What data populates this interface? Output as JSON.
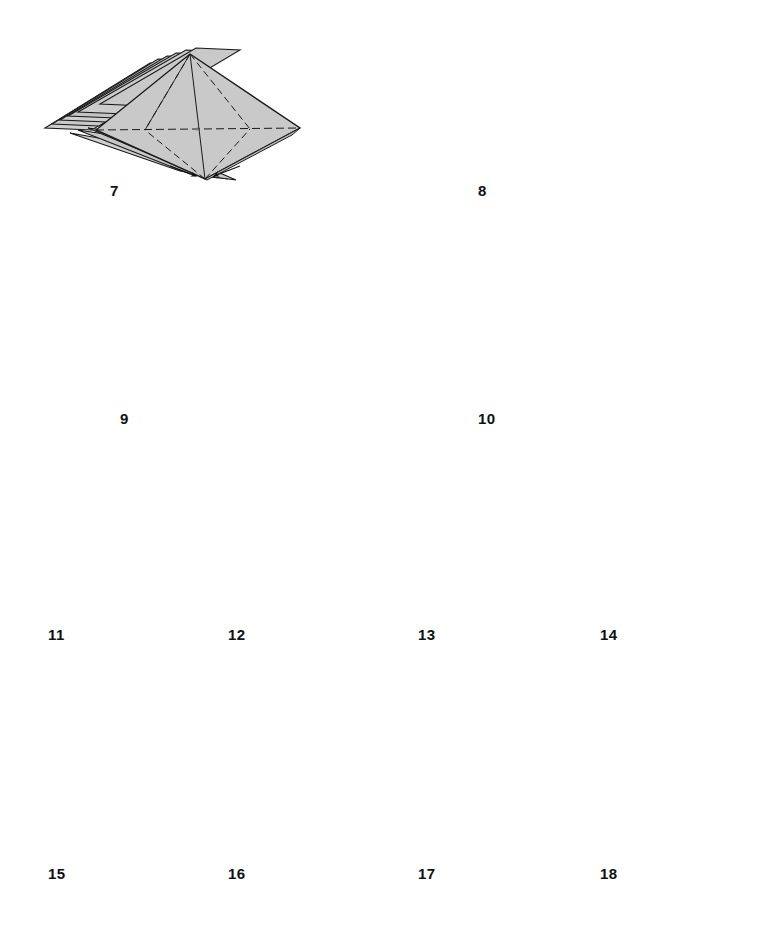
{
  "document": {
    "kind": "origami-instruction-diagram",
    "page_background": "#ffffff",
    "paper_fill": "#c9c9c9",
    "paper_fill_light": "#d6d6d6",
    "paper_fill_dark": "#b4b4b4",
    "line_color": "#1a1a1a",
    "crease_color": "#333333",
    "total_steps": 12,
    "step_range": "7-18"
  },
  "rows": [
    {
      "name": "row-1",
      "steps": [
        "7",
        "8"
      ]
    },
    {
      "name": "row-2",
      "steps": [
        "9",
        "10"
      ]
    },
    {
      "name": "row-3",
      "steps": [
        "11",
        "12",
        "13",
        "14"
      ]
    },
    {
      "name": "row-4",
      "steps": [
        "15",
        "16",
        "17",
        "18"
      ]
    }
  ],
  "steps": [
    {
      "number": "7",
      "label": "7",
      "label_x": 110,
      "label_y": 183,
      "figure": "flat-pleated-stack-3d",
      "description": "Three-dimensional view of a pleated square base stack seen from above with dashed diagonal creases converging at center",
      "has_dashed_creases": true,
      "has_arrows": false
    },
    {
      "number": "8",
      "label": "8",
      "label_x": 478,
      "label_y": 183,
      "figure": "flat-pleated-stack-3d-collapsed",
      "description": "Same stack after partially collapsing, central pleat pulled together, fine radial creases visible",
      "has_dashed_creases": false,
      "has_arrows": false
    },
    {
      "number": "9",
      "label": "9",
      "label_x": 120,
      "label_y": 411,
      "figure": "accordion-strip-side-view",
      "description": "Accordion-pleated strip seen edge-on with four radial star crease groups; small straight arrows point inward at each star center",
      "cells": 4,
      "arrows": 4,
      "arrow_type": "push-in-straight",
      "has_dashed_creases": false
    },
    {
      "number": "10",
      "label": "10",
      "label_x": 478,
      "label_y": 411,
      "figure": "flat-rectangle-crease-pattern",
      "description": "Flattened rectangle showing complete crease pattern of valley (dashed) and mountain (dash-dot) folds in four radial star units; loop arrows wrap around top and bottom edges",
      "cells": 4,
      "top_loop_arrows": 5,
      "bottom_loop_arrows": 5,
      "has_dashed_creases": true
    },
    {
      "number": "11",
      "label": "11",
      "label_x": 48,
      "label_y": 627,
      "figure": "fanned-diamond-stack",
      "description": "Stack of diamond-shaped layers fanned out to the left showing many separate sheets",
      "layers": 6,
      "has_arrows": false
    },
    {
      "number": "12",
      "label": "12",
      "label_x": 228,
      "label_y": 627,
      "figure": "kite-base-with-mountain-creases",
      "description": "Kite/diamond shape with dash-dot mountain creases from side corners down to bottom point; small curled arrows at both side corners",
      "arrows": 2,
      "arrow_type": "curl-small",
      "has_dashed_creases": true
    },
    {
      "number": "13",
      "label": "13",
      "label_x": 418,
      "label_y": 627,
      "figure": "diamond-with-center-valley-fold",
      "description": "Diamond with vertical dashed valley fold down the middle and a curved arrow sweeping to the right",
      "arrows": 1,
      "arrow_type": "curved-fold-right",
      "has_dashed_creases": true
    },
    {
      "number": "14",
      "label": "14",
      "label_x": 600,
      "label_y": 627,
      "figure": "diamond-with-right-flap-folded",
      "description": "Diamond with a small triangular flap folded over on the right side; dashed fold line and curved arrow on the left side",
      "arrows": 1,
      "arrow_type": "curved-fold-right",
      "has_dashed_creases": true
    },
    {
      "number": "15",
      "label": "15",
      "label_x": 48,
      "label_y": 866,
      "figure": "diamond-two-flaps-and-curl",
      "description": "Diamond with flaps on both left and right; vertical dashed valley crease, curved arrow over the top and a small curl arrow at the left corner",
      "arrows": 2,
      "arrow_type": "curved-fold-right",
      "has_dashed_creases": true
    },
    {
      "number": "16",
      "label": "16",
      "label_x": 228,
      "label_y": 866,
      "figure": "diamond-narrow-flap-and-curl",
      "description": "Diamond with a narrow folded flap on the right, vertical dashed centre crease, curved arrow across the top and a small curl arrow at the left corner",
      "arrows": 2,
      "arrow_type": "curved-fold-right",
      "has_dashed_creases": true
    },
    {
      "number": "17",
      "label": "17",
      "label_x": 418,
      "label_y": 866,
      "figure": "diamond-plain-with-flap-seam",
      "description": "Plain diamond showing the resulting folded flap seam on the right half; no arrows or crease marks",
      "arrows": 0,
      "has_dashed_creases": false
    },
    {
      "number": "18",
      "label": "18",
      "label_x": 600,
      "label_y": 866,
      "figure": "diamond-symmetric-pull-open",
      "description": "Symmetric diamond with a horizontal seam across the middle and small outward arrows at left and right corners indicating pulling open",
      "arrows": 2,
      "arrow_type": "outward-double",
      "has_dashed_creases": false
    }
  ]
}
